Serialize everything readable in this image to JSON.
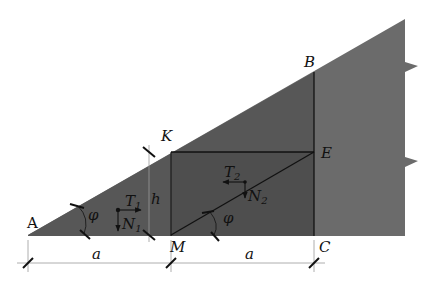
{
  "figure": {
    "type": "geometric-mechanics-diagram",
    "colors": {
      "background": "#ffffff",
      "slope_body": "#6b6b6b",
      "wedge_dark": "#555555",
      "rect_dark": "#4d4d4d",
      "lines": "#111111"
    },
    "points": {
      "A": {
        "label": "A",
        "x": 28,
        "y": 235
      },
      "B": {
        "label": "B",
        "x": 314,
        "y": 72
      },
      "C": {
        "label": "C",
        "x": 314,
        "y": 235
      },
      "E": {
        "label": "E",
        "x": 314,
        "y": 152
      },
      "K": {
        "label": "K",
        "x": 171,
        "y": 152
      },
      "M": {
        "label": "M",
        "x": 171,
        "y": 235
      }
    },
    "labels": {
      "A": "A",
      "B": "B",
      "C": "C",
      "E": "E",
      "K": "K",
      "M": "M",
      "h": "h",
      "a_left": "a",
      "a_right": "a",
      "phi_left": "φ",
      "phi_right": "φ",
      "T1": "T",
      "T1_sub": "1",
      "N1": "N",
      "N1_sub": "1",
      "T2": "T",
      "T2_sub": "2",
      "N2": "N",
      "N2_sub": "2"
    },
    "forces": [
      {
        "name": "T1",
        "direction": "right",
        "origin": [
          118,
          210
        ]
      },
      {
        "name": "N1",
        "direction": "down",
        "origin": [
          118,
          210
        ]
      },
      {
        "name": "T2",
        "direction": "left",
        "origin": [
          245,
          182
        ]
      },
      {
        "name": "N2",
        "direction": "down",
        "origin": [
          245,
          182
        ]
      }
    ],
    "dimensions": [
      {
        "name": "a",
        "from": "A",
        "to": "M"
      },
      {
        "name": "a",
        "from": "M",
        "to": "C"
      },
      {
        "name": "h",
        "from": "K-level",
        "to": "M-level"
      }
    ],
    "angles": [
      {
        "name": "φ",
        "at": "A",
        "between": "base and slope AB"
      },
      {
        "name": "φ",
        "at": "M",
        "between": "base and line ME"
      }
    ]
  }
}
